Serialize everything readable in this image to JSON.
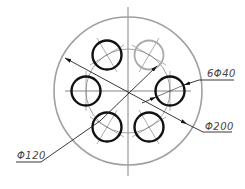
{
  "drawing": {
    "title": "Flange with six holes on bolt circle",
    "center": {
      "x": 128,
      "y": 91
    },
    "outer_circle": {
      "radius": 74,
      "color": "#a0a0a0",
      "dimension_label": "Φ200"
    },
    "bolt_circle": {
      "radius": 42,
      "color": "#8a8a8a",
      "dimension_label": "Φ120"
    },
    "holes": {
      "count": 6,
      "radius": 14.5,
      "dimension_label": "6Φ40",
      "color": "#111111",
      "highlight_color": "#aaaaaa",
      "items": [
        {
          "angle_deg": 0,
          "cx": 170,
          "cy": 91,
          "style": "bold"
        },
        {
          "angle_deg": 60,
          "cx": 149,
          "cy": 127,
          "style": "bold"
        },
        {
          "angle_deg": 120,
          "cx": 107,
          "cy": 127,
          "style": "bold"
        },
        {
          "angle_deg": 180,
          "cx": 86,
          "cy": 91,
          "style": "bold"
        },
        {
          "angle_deg": 240,
          "cx": 107,
          "cy": 55,
          "style": "bold"
        },
        {
          "angle_deg": 300,
          "cx": 149,
          "cy": 55,
          "style": "light"
        }
      ]
    },
    "labels": {
      "outer_diameter": "Φ200",
      "bolt_circle_diameter": "Φ120",
      "hole_spec": "6Φ40"
    },
    "colors": {
      "line": "#222222",
      "centerline": "#666666",
      "background": "#ffffff"
    }
  }
}
